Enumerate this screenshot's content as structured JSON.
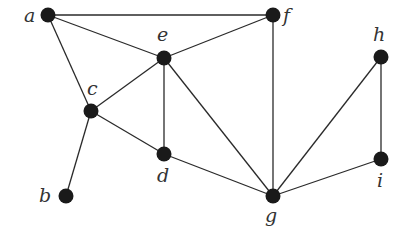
{
  "graph": {
    "nodes": [
      {
        "id": "a",
        "label": "a",
        "x": 48,
        "y": 15,
        "lx": 24,
        "ly": 22
      },
      {
        "id": "f",
        "label": "f",
        "x": 273,
        "y": 15,
        "lx": 283,
        "ly": 22
      },
      {
        "id": "e",
        "label": "e",
        "x": 164,
        "y": 58,
        "lx": 157,
        "ly": 41
      },
      {
        "id": "c",
        "label": "c",
        "x": 91,
        "y": 111,
        "lx": 87,
        "ly": 95
      },
      {
        "id": "d",
        "label": "d",
        "x": 164,
        "y": 154,
        "lx": 157,
        "ly": 182
      },
      {
        "id": "b",
        "label": "b",
        "x": 66,
        "y": 196,
        "lx": 39,
        "ly": 202
      },
      {
        "id": "g",
        "label": "g",
        "x": 273,
        "y": 196,
        "lx": 265,
        "ly": 222
      },
      {
        "id": "h",
        "label": "h",
        "x": 381,
        "y": 57,
        "lx": 373,
        "ly": 41
      },
      {
        "id": "i",
        "label": "i",
        "x": 381,
        "y": 159,
        "lx": 377,
        "ly": 187
      }
    ],
    "edges": [
      [
        "a",
        "f"
      ],
      [
        "a",
        "e"
      ],
      [
        "a",
        "c"
      ],
      [
        "e",
        "f"
      ],
      [
        "c",
        "e"
      ],
      [
        "e",
        "d"
      ],
      [
        "e",
        "g"
      ],
      [
        "c",
        "d"
      ],
      [
        "c",
        "b"
      ],
      [
        "f",
        "g"
      ],
      [
        "d",
        "g"
      ],
      [
        "g",
        "h"
      ],
      [
        "g",
        "i"
      ],
      [
        "h",
        "i"
      ]
    ]
  }
}
